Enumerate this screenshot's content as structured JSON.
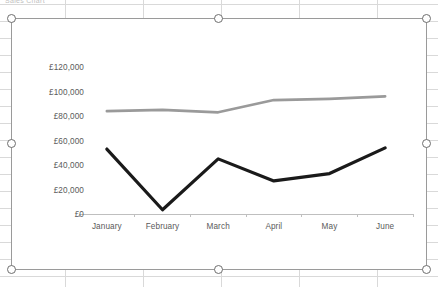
{
  "sheet": {
    "clipped_text": "Sales Chart"
  },
  "chart_object": {
    "name": "line-chart",
    "selected": true,
    "handles": [
      "top-left",
      "top-center",
      "top-right",
      "middle-left",
      "middle-right",
      "bottom-left",
      "bottom-center",
      "bottom-right"
    ]
  },
  "chart_data": {
    "type": "line",
    "title": "",
    "xlabel": "",
    "ylabel": "",
    "categories": [
      "January",
      "February",
      "March",
      "April",
      "May",
      "June"
    ],
    "series": [
      {
        "name": "Series 2",
        "color": "#9a9a9a",
        "width": 2.6,
        "values": [
          84000,
          85000,
          83000,
          93000,
          94000,
          96000
        ]
      },
      {
        "name": "Series 1",
        "color": "#1a1a1a",
        "width": 3.2,
        "values": [
          53000,
          3500,
          45000,
          27000,
          33000,
          54000
        ]
      }
    ],
    "ylim": [
      0,
      120000
    ],
    "ytick_values": [
      120000,
      100000,
      80000,
      60000,
      40000,
      20000,
      0
    ],
    "ytick_labels": [
      "£120,000",
      "£100,000",
      "£80,000",
      "£60,000",
      "£40,000",
      "£20,000",
      "£0"
    ],
    "grid": false,
    "legend": "none",
    "axis_line_color": "#bfbfbf"
  }
}
